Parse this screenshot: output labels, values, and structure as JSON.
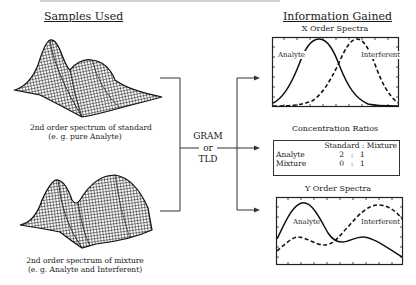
{
  "left_column": {
    "heading": "Samples Used",
    "samples": [
      {
        "surface": "standard-spectrum-surface",
        "caption_line1": "2nd order spectrum of standard",
        "caption_line2": "(e. g. pure Analyte)"
      },
      {
        "surface": "mixture-spectrum-surface",
        "caption_line1": "2nd order spectrum of mixture",
        "caption_line2": "(e. g. Analyte and Interferent)"
      }
    ]
  },
  "method": {
    "line1": "GRAM",
    "line2": "or",
    "line3": "TLD"
  },
  "right_column": {
    "heading": "Information Gained",
    "x_spectra": {
      "title": "X Order Spectra",
      "label_analyte": "Analyte",
      "label_interferent": "Interferent"
    },
    "concentration": {
      "title": "Concentration Ratios",
      "header": "Standard : Mixture",
      "rows": [
        {
          "label": "Analyte",
          "standard": "2",
          "sep": ":",
          "mixture": "1"
        },
        {
          "label": "Mixture",
          "standard": "0",
          "sep": ":",
          "mixture": "1"
        }
      ]
    },
    "y_spectra": {
      "title": "Y Order Spectra",
      "label_analyte": "Analyte",
      "label_interferent": "Interferent"
    }
  },
  "colors": {
    "ink": "#1a1a1a",
    "background": "#ffffff"
  }
}
